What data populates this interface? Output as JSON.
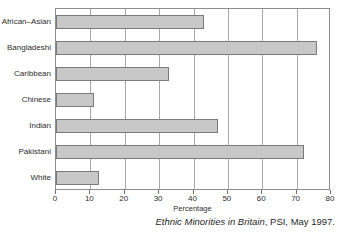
{
  "chart_data": {
    "type": "bar",
    "orientation": "horizontal",
    "title": "",
    "subtitle": "",
    "xlabel": "Percentage",
    "ylabel": "",
    "xlim": [
      0,
      80
    ],
    "xticks": [
      0,
      10,
      20,
      30,
      40,
      50,
      60,
      70,
      80
    ],
    "xtick_labels": [
      "0",
      "10",
      "20",
      "30",
      "40",
      "50",
      "60",
      "70",
      "80"
    ],
    "grid": "vertical",
    "legend": "none",
    "categories": [
      "African–Asian",
      "Bangladeshi",
      "Caribbean",
      "Chinese",
      "Indian",
      "Pakistani",
      "White"
    ],
    "values": [
      43,
      76,
      33,
      11,
      47,
      72,
      12.5
    ],
    "series": [
      {
        "name": "Percentage",
        "values": [
          43,
          76,
          33,
          11,
          47,
          72,
          12.5
        ]
      }
    ],
    "bar_fill_color": "#c8c8c8",
    "bar_border_color": "#7a7a7a",
    "gridline_color": "#a9a9a9",
    "frame_color": "#8d8d8d"
  },
  "caption": {
    "source_title": "Ethnic Minorities in Britain",
    "source_rest": ", PSI, May 1997."
  }
}
